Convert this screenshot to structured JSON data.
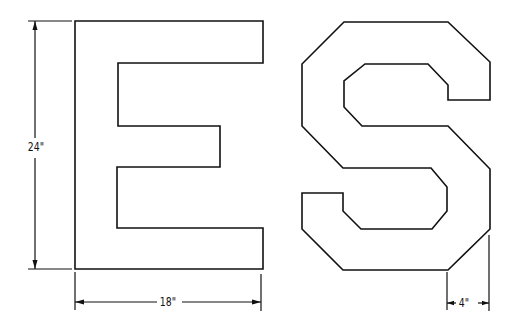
{
  "figure": {
    "letters": [
      "E",
      "S"
    ],
    "stroke_color": "#111111",
    "background": "#ffffff"
  },
  "dimensions": {
    "height": {
      "label": "24\"",
      "target": "letter E height"
    },
    "width": {
      "label": "18\"",
      "target": "letter E width"
    },
    "stroke_width": {
      "label": "4\"",
      "target": "letter S stroke / chamfer width"
    }
  }
}
